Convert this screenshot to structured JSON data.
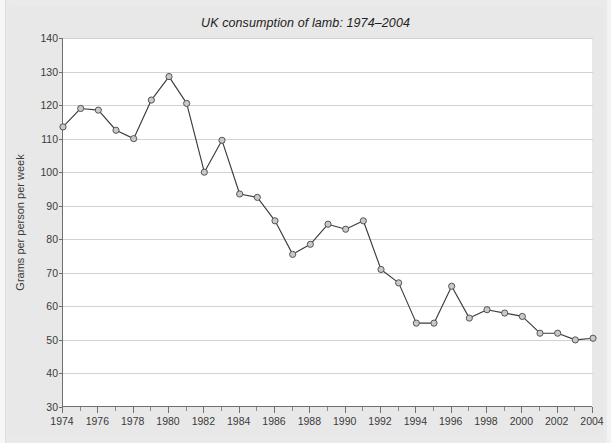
{
  "chart_data": {
    "type": "line",
    "title": "UK consumption of lamb: 1974–2004",
    "xlabel": "",
    "ylabel": "Grams per person per week",
    "xlim": [
      1974,
      2004
    ],
    "ylim": [
      30,
      140
    ],
    "ytick_step": 10,
    "yticks": [
      30,
      40,
      50,
      60,
      70,
      80,
      90,
      100,
      110,
      120,
      130,
      140
    ],
    "xticks_major": [
      1974,
      1976,
      1978,
      1980,
      1982,
      1984,
      1986,
      1988,
      1990,
      1992,
      1994,
      1996,
      1998,
      2000,
      2002,
      2004
    ],
    "xticks_minor": [
      1975,
      1977,
      1979,
      1981,
      1983,
      1985,
      1987,
      1989,
      1991,
      1993,
      1995,
      1997,
      1999,
      2001,
      2003
    ],
    "grid": "horizontal",
    "legend": "none",
    "marker": "circle",
    "x": [
      1974,
      1975,
      1976,
      1977,
      1978,
      1979,
      1980,
      1981,
      1982,
      1983,
      1984,
      1985,
      1986,
      1987,
      1988,
      1989,
      1990,
      1991,
      1992,
      1993,
      1994,
      1995,
      1996,
      1997,
      1998,
      1999,
      2000,
      2001,
      2002,
      2003,
      2004
    ],
    "values": [
      113.5,
      119,
      118.5,
      112.5,
      110,
      121.5,
      128.5,
      120.5,
      100,
      109.5,
      93.5,
      92.5,
      85.5,
      75.5,
      78.5,
      84.5,
      83,
      85.5,
      71,
      67,
      55,
      55,
      66,
      56.5,
      59,
      58,
      57,
      52,
      52,
      50,
      50.5
    ],
    "series": [
      {
        "name": "UK lamb consumption",
        "values": [
          113.5,
          119,
          118.5,
          112.5,
          110,
          121.5,
          128.5,
          120.5,
          100,
          109.5,
          93.5,
          92.5,
          85.5,
          75.5,
          78.5,
          84.5,
          83,
          85.5,
          71,
          67,
          55,
          55,
          66,
          56.5,
          59,
          58,
          57,
          52,
          52,
          50,
          50.5
        ]
      }
    ],
    "colors": {
      "line": "#3d3d3d",
      "marker_fill": "#c9c9c9",
      "marker_stroke": "#555555",
      "grid": "#d2d2d2",
      "axis": "#6f6f6f",
      "plot_background": "#ffffff",
      "figure_background": "#e8e8e8"
    }
  }
}
